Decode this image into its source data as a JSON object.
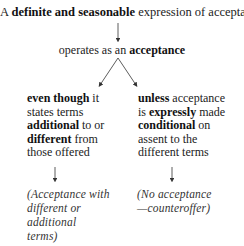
{
  "title": {
    "prefix": "A ",
    "bold": "definite and seasonable",
    "suffix": " expression of acceptance"
  },
  "middle": {
    "prefix": "operates as an ",
    "bold": "acceptance"
  },
  "left_branch": {
    "lines": [
      {
        "bold": "even though",
        "rest": " it"
      },
      {
        "bold": "",
        "rest": "states terms"
      },
      {
        "bold": "additional",
        "rest": " to or"
      },
      {
        "bold": "different",
        "rest": " from"
      },
      {
        "bold": "",
        "rest": "those offered"
      }
    ],
    "result_lines": [
      "(Acceptance with",
      "different or",
      "additional",
      "terms)"
    ]
  },
  "right_branch": {
    "lines": [
      {
        "bold": "unless",
        "rest": " acceptance"
      },
      {
        "pre": "is ",
        "bold": "expressly",
        "rest": " made"
      },
      {
        "bold": "conditional",
        "rest": " on"
      },
      {
        "bold": "",
        "rest": "assent to the"
      },
      {
        "bold": "",
        "rest": "different terms"
      }
    ],
    "result_lines": [
      "(No acceptance",
      "—counteroffer)"
    ]
  },
  "colors": {
    "text": "#222222",
    "lines": "#333333",
    "background": "#ffffff"
  }
}
